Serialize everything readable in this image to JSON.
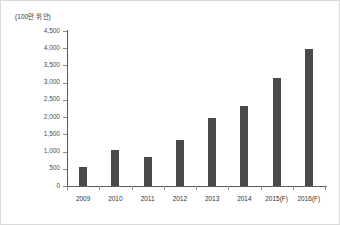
{
  "chart_data": {
    "type": "bar",
    "title": "",
    "subtitle": "",
    "unit_label": "(100만 위안)",
    "xlabel": "",
    "ylabel": "",
    "categories": [
      "2009",
      "2010",
      "2011",
      "2012",
      "2013",
      "2014",
      "2015(F)",
      "2016(F)"
    ],
    "values": [
      560,
      1060,
      830,
      1350,
      1980,
      2310,
      3130,
      3990
    ],
    "ylim": [
      0,
      4500
    ],
    "ytick_labels": [
      "0",
      "500",
      "1,000",
      "1,500",
      "2,000",
      "2,500",
      "3,000",
      "3,500",
      "4,000",
      "4,500"
    ],
    "ytick_values": [
      0,
      500,
      1000,
      1500,
      2000,
      2500,
      3000,
      3500,
      4000,
      4500
    ],
    "grid": false,
    "legend": "none",
    "bar_color": "#4a4a4a",
    "axis_color": "#595959",
    "border_color": "#d9d9d9"
  }
}
